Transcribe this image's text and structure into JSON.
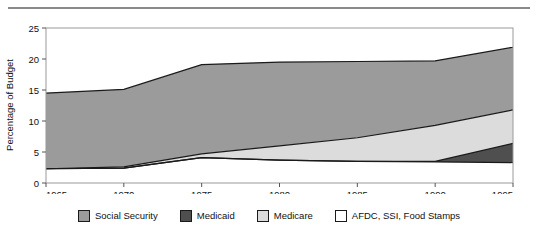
{
  "chart_data": {
    "type": "area",
    "stacked": true,
    "title": "",
    "xlabel": "",
    "ylabel": "Percentage of Budget",
    "xlim": [
      1965,
      1995
    ],
    "ylim": [
      0,
      25
    ],
    "xticks": [
      1965,
      1970,
      1975,
      1980,
      1985,
      1990,
      1995
    ],
    "yticks": [
      0,
      5,
      10,
      15,
      20,
      25
    ],
    "grid": false,
    "legend_position": "bottom",
    "x": [
      1965,
      1970,
      1975,
      1980,
      1985,
      1990,
      1995
    ],
    "series": [
      {
        "name": "AFDC, SSI, Food Stamps",
        "color": "#ffffff",
        "values": [
          2.3,
          2.4,
          4.1,
          3.7,
          3.5,
          3.4,
          3.3
        ]
      },
      {
        "name": "Medicaid",
        "color": "#4f4f4f",
        "values": [
          0.0,
          0.0,
          0.0,
          0.0,
          0.0,
          0.1,
          3.1
        ]
      },
      {
        "name": "Medicare",
        "color": "#dcdcdc",
        "values": [
          0.0,
          0.2,
          0.6,
          2.3,
          3.8,
          5.8,
          5.4
        ]
      },
      {
        "name": "Social Security",
        "color": "#9b9b9b",
        "values": [
          12.2,
          12.5,
          14.4,
          13.5,
          12.3,
          10.4,
          10.1
        ]
      }
    ],
    "cumulative_top_boundary": [
      14.5,
      15.1,
      19.1,
      19.5,
      19.6,
      19.7,
      21.9
    ]
  },
  "legend": {
    "items": [
      {
        "label": "Social Security",
        "color": "#9b9b9b"
      },
      {
        "label": "Medicaid",
        "color": "#4f4f4f"
      },
      {
        "label": "Medicare",
        "color": "#dcdcdc"
      },
      {
        "label": "AFDC, SSI, Food Stamps",
        "color": "#ffffff"
      }
    ]
  },
  "axes": {
    "y_title": "Percentage of Budget",
    "y_ticks": [
      "0",
      "5",
      "10",
      "15",
      "20",
      "25"
    ],
    "x_ticks": [
      "1965",
      "1970",
      "1975",
      "1980",
      "1985",
      "1990",
      "1995"
    ]
  }
}
